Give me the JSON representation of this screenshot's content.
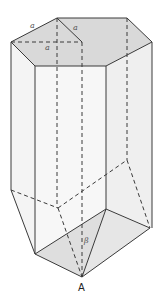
{
  "figure": {
    "colors": {
      "stroke": "#3a3a3a",
      "top_face": "#d9d9d9",
      "side_face": "#f2f2f2",
      "bottom_face": "#e3e3e3"
    },
    "labels": {
      "edge_top_left": "a",
      "edge_top_inner": "a",
      "edge_top_dashed": "a",
      "angle": "β",
      "vertex": "A"
    }
  }
}
